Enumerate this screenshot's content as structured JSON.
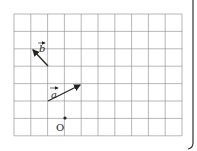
{
  "diagram": {
    "grid": {
      "cols": 10,
      "rows": 7,
      "left": 14,
      "top": 14,
      "cell_w": 16.8,
      "cell_h": 17.4,
      "color": "#777777"
    },
    "vectors": [
      {
        "name": "b",
        "label": "b",
        "from": [
          48,
          66
        ],
        "to": [
          32,
          49
        ]
      },
      {
        "name": "a",
        "label": "a",
        "from": [
          48,
          101
        ],
        "to": [
          81,
          84
        ]
      }
    ],
    "origin": {
      "label": "O",
      "point": [
        65,
        118
      ]
    },
    "bracket_color": "#333333"
  }
}
